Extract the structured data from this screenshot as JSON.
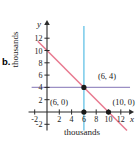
{
  "figure": {
    "part_label": "b.",
    "y_axis_units": "thousands",
    "x_axis_units": "thousands",
    "x_axis_letter": "x",
    "y_axis_letter": "y"
  },
  "chart_data": {
    "type": "line",
    "title": "",
    "xlabel": "thousands",
    "ylabel": "thousands",
    "xlim": [
      -3,
      14
    ],
    "ylim": [
      -3,
      14
    ],
    "grid": false,
    "legend": "none",
    "x_ticks": [
      "-2",
      "2",
      "4",
      "6",
      "8",
      "10",
      "12"
    ],
    "x_tick_values": [
      -2,
      2,
      4,
      6,
      8,
      10,
      12
    ],
    "y_ticks": [
      "12",
      "10",
      "8",
      "6",
      "4",
      "2",
      "-2"
    ],
    "y_tick_values": [
      12,
      10,
      8,
      6,
      4,
      2,
      -2
    ],
    "series": [
      {
        "name": "diagonal-boundary",
        "color": "#e8798f",
        "type": "line",
        "x": [
          -1.5,
          13
        ],
        "y": [
          11.5,
          -3
        ],
        "equation_points": [
          [
            0,
            10
          ],
          [
            10,
            0
          ]
        ]
      },
      {
        "name": "vertical-boundary",
        "color": "#6ec6e8",
        "type": "vline",
        "x": 6,
        "y": [
          -3,
          14
        ]
      },
      {
        "name": "horizontal-boundary",
        "color": "#9b8fc4",
        "type": "hline",
        "y": 4,
        "x": [
          -2.5,
          13.5
        ]
      }
    ],
    "points": [
      {
        "label": "(6, 4)",
        "x": 6,
        "y": 4,
        "label_dx": 14,
        "label_dy": -8
      },
      {
        "label": "(6, 0)",
        "x": 6,
        "y": 0,
        "label_dx": -34,
        "label_dy": -7
      },
      {
        "label": "(10, 0)",
        "x": 10,
        "y": 0,
        "label_dx": 4,
        "label_dy": -7
      }
    ]
  }
}
